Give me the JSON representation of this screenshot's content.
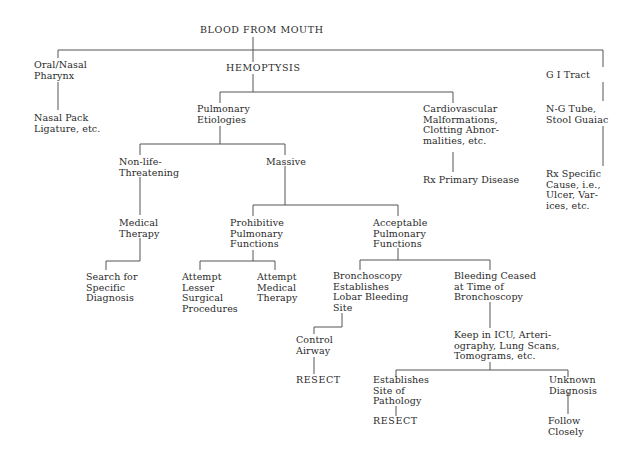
{
  "diagram": {
    "title": "BLOOD FROM MOUTH",
    "line_color": "#555555",
    "text_color": "#2a2a2a",
    "nodes": {
      "root": {
        "lines": [
          "BLOOD FROM MOUTH"
        ]
      },
      "oral": {
        "lines": [
          "Oral/Nasal",
          "Pharynx"
        ]
      },
      "nasal_pack": {
        "lines": [
          "Nasal Pack",
          "Ligature, etc."
        ]
      },
      "hemoptysis": {
        "lines": [
          "HEMOPTYSIS"
        ]
      },
      "gi_tract": {
        "lines": [
          "G I Tract"
        ]
      },
      "ng_tube": {
        "lines": [
          "N-G Tube,",
          "Stool Guaiac"
        ]
      },
      "rx_specific": {
        "lines": [
          "Rx Specific",
          "Cause, i.e.,",
          "Ulcer, Var-",
          "ices, etc."
        ]
      },
      "pulmonary": {
        "lines": [
          "Pulmonary",
          "Etiologies"
        ]
      },
      "cardio": {
        "lines": [
          "Cardiovascular",
          "Malformations,",
          "Clotting Abnor-",
          "malities, etc."
        ]
      },
      "rx_primary": {
        "lines": [
          "Rx Primary Disease"
        ]
      },
      "nonlife": {
        "lines": [
          "Non-life-",
          "Threatening"
        ]
      },
      "massive": {
        "lines": [
          "Massive"
        ]
      },
      "medical_therapy": {
        "lines": [
          "Medical",
          "Therapy"
        ]
      },
      "search": {
        "lines": [
          "Search for",
          "Specific",
          "Diagnosis"
        ]
      },
      "prohibitive": {
        "lines": [
          "Prohibitive",
          "Pulmonary",
          "Functions"
        ]
      },
      "acceptable": {
        "lines": [
          "Acceptable",
          "Pulmonary",
          "Functions"
        ]
      },
      "attempt_lesser": {
        "lines": [
          "Attempt",
          "Lesser",
          "Surgical",
          "Procedures"
        ]
      },
      "attempt_medical": {
        "lines": [
          "Attempt",
          "Medical",
          "Therapy"
        ]
      },
      "broncho_establishes": {
        "lines": [
          "Bronchoscopy",
          "Establishes",
          "Lobar Bleeding",
          "Site"
        ]
      },
      "bleeding_ceased": {
        "lines": [
          "Bleeding Ceased",
          "at Time of",
          "Bronchoscopy"
        ]
      },
      "control_airway": {
        "lines": [
          "Control",
          "Airway"
        ]
      },
      "resect_1": {
        "lines": [
          "RESECT"
        ]
      },
      "keep_icu": {
        "lines": [
          "Keep in ICU, Arteri-",
          "ography, Lung Scans,",
          "Tomograms, etc."
        ]
      },
      "establishes_site": {
        "lines": [
          "Establishes",
          "Site of",
          "Pathology"
        ]
      },
      "unknown_diag": {
        "lines": [
          "Unknown",
          "Diagnosis"
        ]
      },
      "resect_2": {
        "lines": [
          "RESECT"
        ]
      },
      "follow": {
        "lines": [
          "Follow",
          "Closely"
        ]
      }
    }
  }
}
